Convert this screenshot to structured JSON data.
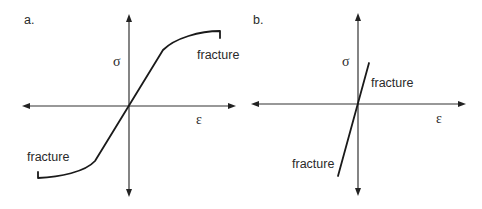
{
  "panels": [
    {
      "id": "a",
      "label": "a.",
      "y_axis_label": "σ",
      "x_axis_label": "ε",
      "annotations": {
        "upper": "fracture",
        "lower": "fracture"
      },
      "description": "Stress-strain curve: linear elastic through origin, curving to plastic region in tension and compression, ending in fracture"
    },
    {
      "id": "b",
      "label": "b.",
      "y_axis_label": "σ",
      "x_axis_label": "ε",
      "annotations": {
        "upper": "fracture",
        "lower": "fracture"
      },
      "description": "Stress-strain curve: steep linear line through origin ending in brittle fracture in both tension and compression"
    }
  ],
  "colors": {
    "line": "#1a1a1a",
    "axis": "#333333",
    "text": "#2a2a2a",
    "background": "#ffffff"
  }
}
